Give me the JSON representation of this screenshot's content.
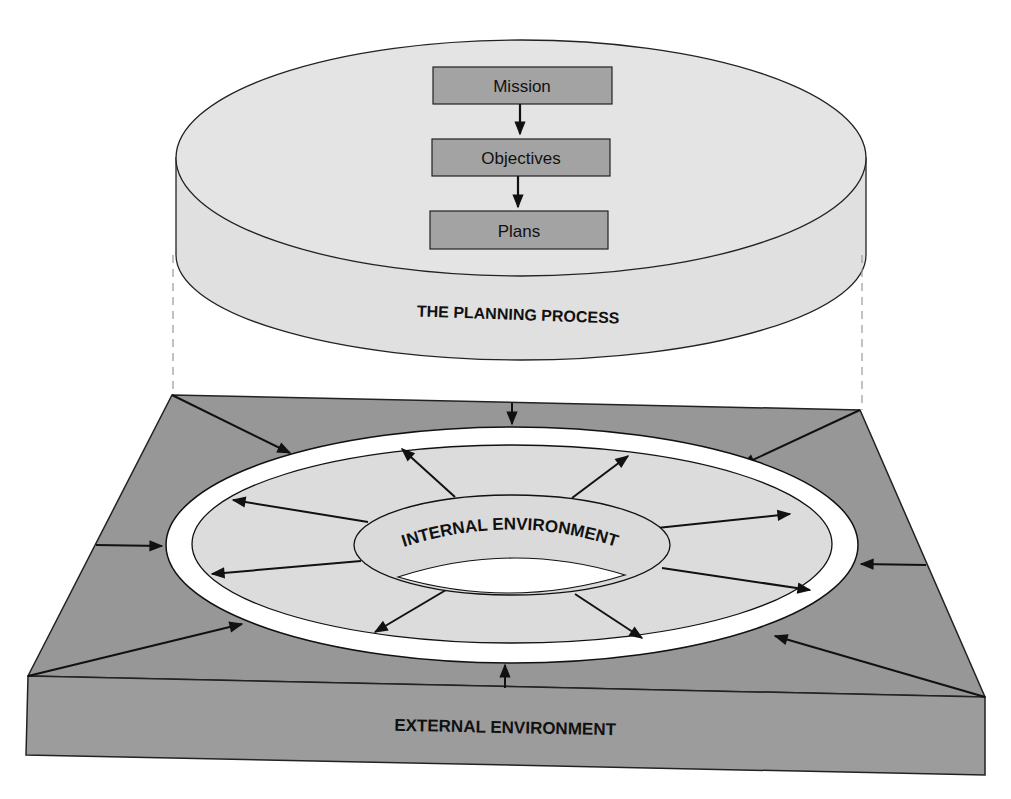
{
  "colors": {
    "platform_top": "#979797",
    "platform_front": "#9a9a9a",
    "disk": "#e3e3e3",
    "box": "#a3a3a3",
    "ring_fill": "#dcdcdc",
    "white": "#ffffff",
    "ink": "#111111"
  },
  "planning": {
    "label": "THE PLANNING PROCESS",
    "steps": [
      {
        "label": "Mission"
      },
      {
        "label": "Objectives"
      },
      {
        "label": "Plans"
      }
    ]
  },
  "internal": {
    "label": "INTERNAL ENVIRONMENT"
  },
  "external": {
    "label": "EXTERNAL ENVIRONMENT"
  }
}
